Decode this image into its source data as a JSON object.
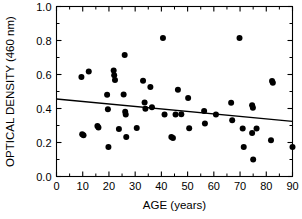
{
  "chart_data": {
    "type": "scatter",
    "title": "",
    "xlabel": "AGE  (years)",
    "ylabel": "OPTICAL DENSITY  (460 nm)",
    "xlim": [
      0,
      90
    ],
    "ylim": [
      0.0,
      1.0
    ],
    "grid": false,
    "legend": null,
    "x_ticks": [
      0,
      10,
      20,
      30,
      40,
      50,
      60,
      70,
      80,
      90
    ],
    "x_tick_labels": [
      "0",
      "10",
      "20",
      "30",
      "40",
      "50",
      "60",
      "70",
      "80",
      "90"
    ],
    "x_minor_step": 5,
    "y_ticks": [
      0.0,
      0.2,
      0.4,
      0.6,
      0.8,
      1.0
    ],
    "y_tick_labels": [
      "0.0",
      "0.2",
      "0.4",
      "0.6",
      "0.8",
      "1.0"
    ],
    "y_minor_step": 0.1,
    "marker": "filled-circle",
    "marker_color": "#000000",
    "points": [
      {
        "x": 9.5,
        "y": 0.585
      },
      {
        "x": 9.8,
        "y": 0.248
      },
      {
        "x": 10.3,
        "y": 0.243
      },
      {
        "x": 12.3,
        "y": 0.617
      },
      {
        "x": 15.6,
        "y": 0.297
      },
      {
        "x": 16.0,
        "y": 0.288
      },
      {
        "x": 19.3,
        "y": 0.481
      },
      {
        "x": 19.6,
        "y": 0.395
      },
      {
        "x": 19.8,
        "y": 0.173
      },
      {
        "x": 21.8,
        "y": 0.623
      },
      {
        "x": 22.0,
        "y": 0.596
      },
      {
        "x": 22.3,
        "y": 0.568
      },
      {
        "x": 23.8,
        "y": 0.279
      },
      {
        "x": 25.6,
        "y": 0.482
      },
      {
        "x": 26.0,
        "y": 0.715
      },
      {
        "x": 26.2,
        "y": 0.381
      },
      {
        "x": 26.4,
        "y": 0.365
      },
      {
        "x": 26.6,
        "y": 0.232
      },
      {
        "x": 30.6,
        "y": 0.285
      },
      {
        "x": 33.0,
        "y": 0.563
      },
      {
        "x": 33.6,
        "y": 0.436
      },
      {
        "x": 33.9,
        "y": 0.398
      },
      {
        "x": 35.8,
        "y": 0.527
      },
      {
        "x": 36.4,
        "y": 0.408
      },
      {
        "x": 40.6,
        "y": 0.815
      },
      {
        "x": 41.2,
        "y": 0.364
      },
      {
        "x": 43.8,
        "y": 0.232
      },
      {
        "x": 44.4,
        "y": 0.227
      },
      {
        "x": 45.4,
        "y": 0.364
      },
      {
        "x": 46.3,
        "y": 0.51
      },
      {
        "x": 47.6,
        "y": 0.366
      },
      {
        "x": 50.2,
        "y": 0.462
      },
      {
        "x": 50.6,
        "y": 0.284
      },
      {
        "x": 56.3,
        "y": 0.385
      },
      {
        "x": 56.6,
        "y": 0.312
      },
      {
        "x": 60.8,
        "y": 0.364
      },
      {
        "x": 66.6,
        "y": 0.434
      },
      {
        "x": 67.0,
        "y": 0.331
      },
      {
        "x": 69.8,
        "y": 0.815
      },
      {
        "x": 71.0,
        "y": 0.283
      },
      {
        "x": 71.4,
        "y": 0.173
      },
      {
        "x": 74.6,
        "y": 0.419
      },
      {
        "x": 74.9,
        "y": 0.405
      },
      {
        "x": 74.6,
        "y": 0.256
      },
      {
        "x": 75.0,
        "y": 0.1
      },
      {
        "x": 76.3,
        "y": 0.283
      },
      {
        "x": 81.8,
        "y": 0.213
      },
      {
        "x": 82.2,
        "y": 0.562
      },
      {
        "x": 82.5,
        "y": 0.551
      },
      {
        "x": 90.0,
        "y": 0.173
      }
    ],
    "trend_line": {
      "type": "linear-regression",
      "x_start": 0,
      "y_start": 0.456,
      "x_end": 90,
      "y_end": 0.324
    }
  },
  "axes": {
    "x_axis_name": "AGE  (years)",
    "y_axis_name": "OPTICAL DENSITY  (460 nm)"
  }
}
